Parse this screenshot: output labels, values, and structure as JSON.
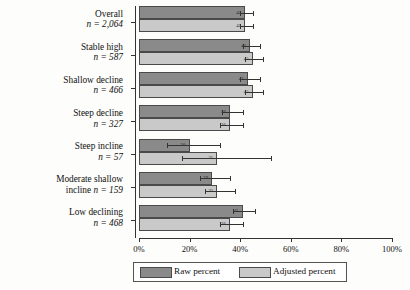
{
  "chart_data": {
    "type": "bar",
    "orientation": "horizontal",
    "title": "",
    "xlabel": "",
    "ylabel": "",
    "xlim": [
      0,
      100
    ],
    "xticks": [
      "0%",
      "20%",
      "40%",
      "60%",
      "80%",
      "100%"
    ],
    "xtick_values": [
      0,
      20,
      40,
      60,
      80,
      100
    ],
    "grid": false,
    "legend_position": "bottom",
    "categories": [
      "Overall",
      "Stable high",
      "Shallow decline",
      "Steep decline",
      "Steep incline",
      "Moderate shallow incline",
      "Low declining"
    ],
    "category_counts": [
      "n = 2,064",
      "n = 587",
      "n = 466",
      "n = 327",
      "n = 57",
      "n = 159",
      "n = 468"
    ],
    "series": [
      {
        "name": "Raw percent",
        "color": "#8a8a8a",
        "values": [
          42,
          44,
          43,
          36,
          20,
          29,
          41
        ],
        "labels": [
          "42",
          "44",
          "43",
          "36",
          "20",
          "29",
          "41"
        ],
        "err_low": [
          40,
          41,
          40,
          33,
          11,
          24,
          37
        ],
        "err_high": [
          45,
          48,
          48,
          41,
          32,
          36,
          46
        ]
      },
      {
        "name": "Adjusted percent",
        "color": "#c9c9c9",
        "values": [
          42,
          45,
          45,
          36,
          31,
          31,
          36
        ],
        "labels": [
          "42",
          "45",
          "45",
          "36",
          "31",
          "31",
          "36"
        ],
        "err_low": [
          40,
          42,
          42,
          32,
          17,
          26,
          32
        ],
        "err_high": [
          45,
          49,
          49,
          41,
          52,
          38,
          41
        ]
      }
    ]
  },
  "legend": {
    "raw_label": "Raw percent",
    "adjusted_label": "Adjusted percent"
  }
}
